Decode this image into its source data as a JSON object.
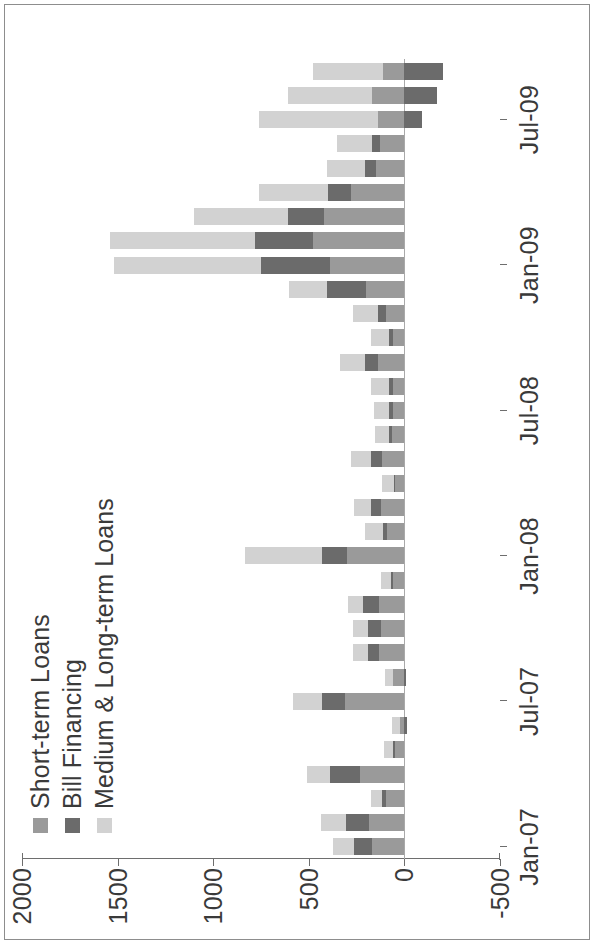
{
  "figure": {
    "background": "#ffffff",
    "frame_color": "#8d8d8d",
    "rotation_note": "printed rotated 90 degrees counter-clockwise"
  },
  "legend": {
    "position": "top-left",
    "items": [
      {
        "label": "Short-term Loans",
        "color": "#9a9a9a"
      },
      {
        "label": "Bill Financing",
        "color": "#6b6b6b"
      },
      {
        "label": "Medium & Long-term Loans",
        "color": "#d2d2d2"
      }
    ]
  },
  "axes": {
    "value_axis": {
      "ticks": [
        "2000",
        "1500",
        "1000",
        "500",
        "0",
        "-500"
      ],
      "min": -500,
      "max": 2000,
      "step": 500
    },
    "category_axis": {
      "ticks": [
        "Jan-07",
        "Jul-07",
        "Jan-08",
        "Jul-08",
        "Jan-09",
        "Jul-09"
      ],
      "tick_every_months": 6
    }
  },
  "chart_data": {
    "type": "bar",
    "orientation": "horizontal-stacked",
    "title": "",
    "subtitle": "",
    "xlabel": "",
    "ylabel": "",
    "ylim": [
      -500,
      2000
    ],
    "grid": false,
    "legend_position": "top-left",
    "stacked": true,
    "categories": [
      "Jan-07",
      "Feb-07",
      "Mar-07",
      "Apr-07",
      "May-07",
      "Jun-07",
      "Jul-07",
      "Aug-07",
      "Sep-07",
      "Oct-07",
      "Nov-07",
      "Dec-07",
      "Jan-08",
      "Feb-08",
      "Mar-08",
      "Apr-08",
      "May-08",
      "Jun-08",
      "Jul-08",
      "Aug-08",
      "Sep-08",
      "Oct-08",
      "Nov-08",
      "Dec-08",
      "Jan-09",
      "Feb-09",
      "Mar-09",
      "Apr-09",
      "May-09",
      "Jun-09",
      "Jul-09",
      "Aug-09",
      "Sep-09"
    ],
    "series": [
      {
        "name": "Short-term Loans",
        "color": "#9a9a9a",
        "values": [
          170,
          185,
          95,
          230,
          50,
          25,
          310,
          60,
          135,
          120,
          135,
          60,
          300,
          90,
          120,
          50,
          115,
          65,
          60,
          60,
          140,
          60,
          95,
          200,
          390,
          480,
          420,
          280,
          150,
          130,
          140,
          170,
          110
        ]
      },
      {
        "name": "Bill Financing",
        "color": "#6b6b6b",
        "values": [
          95,
          120,
          20,
          160,
          10,
          -15,
          120,
          -10,
          55,
          70,
          80,
          10,
          130,
          20,
          55,
          5,
          60,
          15,
          20,
          20,
          65,
          20,
          45,
          205,
          360,
          300,
          190,
          120,
          55,
          40,
          -90,
          -170,
          -200
        ]
      },
      {
        "name": "Medium & Long-term Loans",
        "color": "#d2d2d2",
        "values": [
          110,
          130,
          60,
          120,
          45,
          40,
          155,
          40,
          80,
          80,
          80,
          55,
          405,
          95,
          90,
          60,
          105,
          75,
          80,
          95,
          130,
          95,
          130,
          200,
          770,
          760,
          490,
          360,
          200,
          180,
          620,
          440,
          370
        ]
      }
    ]
  }
}
